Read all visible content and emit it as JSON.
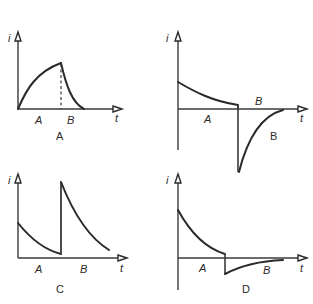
{
  "figure": {
    "panels": [
      {
        "caption": "A",
        "y_label": "i",
        "x_label": "t",
        "region_labels": [
          "A",
          "B"
        ],
        "description": "Current rises exponentially during interval A to a peak, then decays to zero during interval B; dashed line marks boundary"
      },
      {
        "caption": "B",
        "y_label": "i",
        "x_label": "t",
        "region_labels": [
          "A",
          "B"
        ],
        "description": "Current decays from positive value during A, then jumps to large negative value and recovers toward zero during B"
      },
      {
        "caption": "C",
        "y_label": "i",
        "x_label": "t",
        "region_labels": [
          "A",
          "B"
        ],
        "description": "Current decays during A, jumps to a high positive value at boundary, then decays during B"
      },
      {
        "caption": "D",
        "y_label": "i",
        "x_label": "t",
        "region_labels": [
          "A",
          "B"
        ],
        "description": "Current decays from positive value during A, then steps to small negative value and recovers toward zero during B"
      }
    ]
  }
}
